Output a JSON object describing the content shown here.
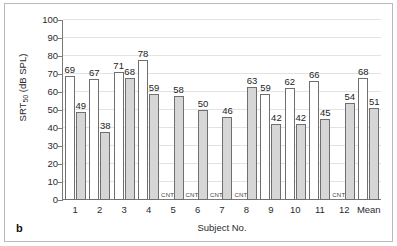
{
  "figure": {
    "panel_letter": "b"
  },
  "chart_data": {
    "type": "bar",
    "title": "",
    "xlabel": "Subject No.",
    "ylabel": "SRT50 (dB SPL)",
    "ylabel_base": "SRT",
    "ylabel_sub": "50",
    "ylabel_unit": " (dB SPL)",
    "ylim": [
      0,
      100
    ],
    "yticks": [
      0,
      10,
      20,
      30,
      40,
      50,
      60,
      70,
      80,
      90,
      100
    ],
    "ytick_labels": [
      "0",
      "10",
      "20",
      "30",
      "40",
      "50",
      "60",
      "70",
      "80",
      "90",
      "100"
    ],
    "grid": true,
    "legend": "none",
    "missing_label": "CNT",
    "categories": [
      "1",
      "2",
      "3",
      "4",
      "5",
      "6",
      "7",
      "8",
      "9",
      "10",
      "11",
      "12",
      "Mean"
    ],
    "series": [
      {
        "name": "series-1",
        "style": "white",
        "values": [
          69,
          67,
          71,
          78,
          null,
          null,
          null,
          null,
          59,
          62,
          66,
          null,
          68
        ],
        "labels": [
          "69",
          "67",
          "71",
          "78",
          "CNT",
          "CNT",
          "CNT",
          "CNT",
          "59",
          "62",
          "66",
          "CNT",
          "68"
        ]
      },
      {
        "name": "series-2",
        "style": "gray",
        "values": [
          49,
          38,
          68,
          59,
          58,
          50,
          46,
          63,
          42,
          42,
          45,
          54,
          51
        ],
        "labels": [
          "49",
          "38",
          "68",
          "59",
          "58",
          "50",
          "46",
          "63",
          "42",
          "42",
          "45",
          "54",
          "51"
        ]
      }
    ],
    "colors": {
      "series1_fill": "#ffffff",
      "series2_fill": "#d6d6d6",
      "bar_stroke": "#6f6f6f",
      "grid": "#e3e3e3",
      "axis": "#7a7a7a",
      "text": "#2b2b2b"
    }
  }
}
